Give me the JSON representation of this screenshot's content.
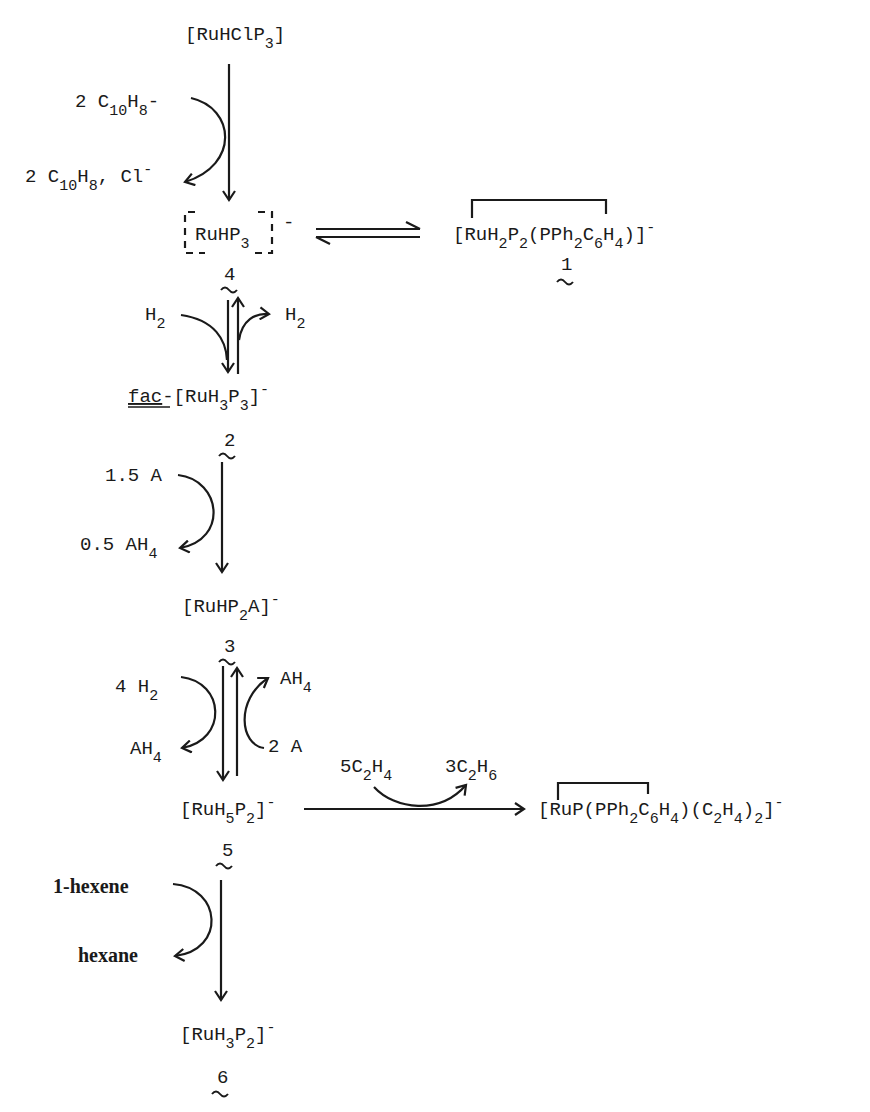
{
  "scheme": {
    "species": {
      "start": {
        "text": "[RuHClP",
        "sub": "3",
        "close": "]"
      },
      "c4": {
        "text": "RuHP",
        "sub": "3",
        "charge": "-",
        "label": "4"
      },
      "c1": {
        "p1": "[RuH",
        "s1": "2",
        "p2": "P",
        "s2": "2",
        "p3": "(PPh",
        "s3": "2",
        "p4": "C",
        "s4": "6",
        "p5": "H",
        "s5": "4",
        "p6": ")]",
        "charge": "-",
        "label": "1"
      },
      "c2": {
        "prefix": "fac",
        "dash": "-[RuH",
        "s1": "3",
        "p2": "P",
        "s2": "3",
        "close": "]",
        "charge": "-",
        "label": "2"
      },
      "c3": {
        "p1": "[RuHP",
        "s1": "2",
        "p2": "A]",
        "charge": "-",
        "label": "3"
      },
      "c5": {
        "p1": "[RuH",
        "s1": "5",
        "p2": "P",
        "s2": "2",
        "close": "]",
        "charge": "-",
        "label": "5"
      },
      "cEth": {
        "p1": "[RuP(PPh",
        "s1": "2",
        "p2": "C",
        "s2": "6",
        "p3": "H",
        "s3": "4",
        "p4": ")(C",
        "s4": "2",
        "p5": "H",
        "s5": "4",
        "p6": ")",
        "s6": "2",
        "p7": "]",
        "charge": "-"
      },
      "c6": {
        "p1": "[RuH",
        "s1": "3",
        "p2": "P",
        "s2": "2",
        "close": "]",
        "charge": "-",
        "label": "6"
      }
    },
    "reagents": {
      "step1_in": {
        "p1": "2 C",
        "s1": "10",
        "p2": "H",
        "s2": "8",
        "sup": "-"
      },
      "step1_out": {
        "p1": "2 C",
        "s1": "10",
        "p2": "H",
        "s2": "8",
        "p3": ", Cl",
        "sup": "-"
      },
      "step2_in": {
        "p1": "H",
        "s1": "2"
      },
      "step2_out": {
        "p1": "H",
        "s1": "2"
      },
      "step3_in": "1.5 A",
      "step3_out": {
        "p1": "0.5 AH",
        "s1": "4"
      },
      "step4_in": {
        "p1": "4 H",
        "s1": "2"
      },
      "step4_out": {
        "p1": "AH",
        "s1": "4"
      },
      "step4r_in": "2 A",
      "step4r_out": {
        "p1": "AH",
        "s1": "4"
      },
      "eth_in": {
        "p1": "5C",
        "s1": "2",
        "p2": "H",
        "s2": "4"
      },
      "eth_out": {
        "p1": "3C",
        "s1": "2",
        "p2": "H",
        "s2": "6"
      },
      "step6_in": "1-hexene",
      "step6_out": "hexane"
    }
  }
}
